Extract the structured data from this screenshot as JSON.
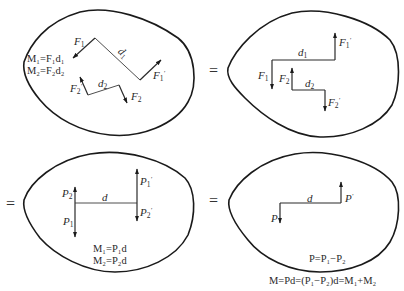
{
  "colors": {
    "stroke": "#1a1a1a",
    "text": "#2a2a2a",
    "background": "#ffffff"
  },
  "equals_sign": "=",
  "panels": [
    {
      "id": "panel-1",
      "description": "Two couples at arbitrary orientation",
      "forces": [
        {
          "name": "F",
          "sub": "1",
          "prime": ""
        },
        {
          "name": "F",
          "sub": "1",
          "prime": "′"
        },
        {
          "name": "F",
          "sub": "2",
          "prime": ""
        },
        {
          "name": "F",
          "sub": "2",
          "prime": "′"
        }
      ],
      "distances": [
        {
          "name": "d",
          "sub": "1"
        },
        {
          "name": "d",
          "sub": "2"
        }
      ],
      "formulas": [
        "M₁=F₁d₁",
        "M₂=F₂d₂"
      ]
    },
    {
      "id": "panel-2",
      "description": "Couples rotated to parallel position",
      "forces": [
        {
          "name": "F",
          "sub": "1",
          "prime": ""
        },
        {
          "name": "F",
          "sub": "1",
          "prime": "′"
        },
        {
          "name": "F",
          "sub": "2",
          "prime": ""
        },
        {
          "name": "F",
          "sub": "2",
          "prime": "′"
        }
      ],
      "distances": [
        {
          "name": "d",
          "sub": "1"
        },
        {
          "name": "d",
          "sub": "2"
        }
      ]
    },
    {
      "id": "panel-3",
      "description": "Couples transformed to common arm d",
      "forces": [
        {
          "name": "P",
          "sub": "2",
          "prime": ""
        },
        {
          "name": "P",
          "sub": "1",
          "prime": ""
        },
        {
          "name": "P",
          "sub": "1",
          "prime": "′"
        },
        {
          "name": "P",
          "sub": "2",
          "prime": "′"
        }
      ],
      "distances": [
        {
          "name": "d",
          "sub": ""
        }
      ],
      "formulas": [
        "M₁=P₁d",
        "M₂=P₂d"
      ]
    },
    {
      "id": "panel-4",
      "description": "Resultant couple",
      "forces": [
        {
          "name": "P",
          "sub": "",
          "prime": ""
        },
        {
          "name": "P",
          "sub": "",
          "prime": "′"
        }
      ],
      "distances": [
        {
          "name": "d",
          "sub": ""
        }
      ],
      "formulas": [
        "P=P₁−P₂",
        "M=Pd=(P₁−P₂)d=M₁+M₂"
      ]
    }
  ]
}
